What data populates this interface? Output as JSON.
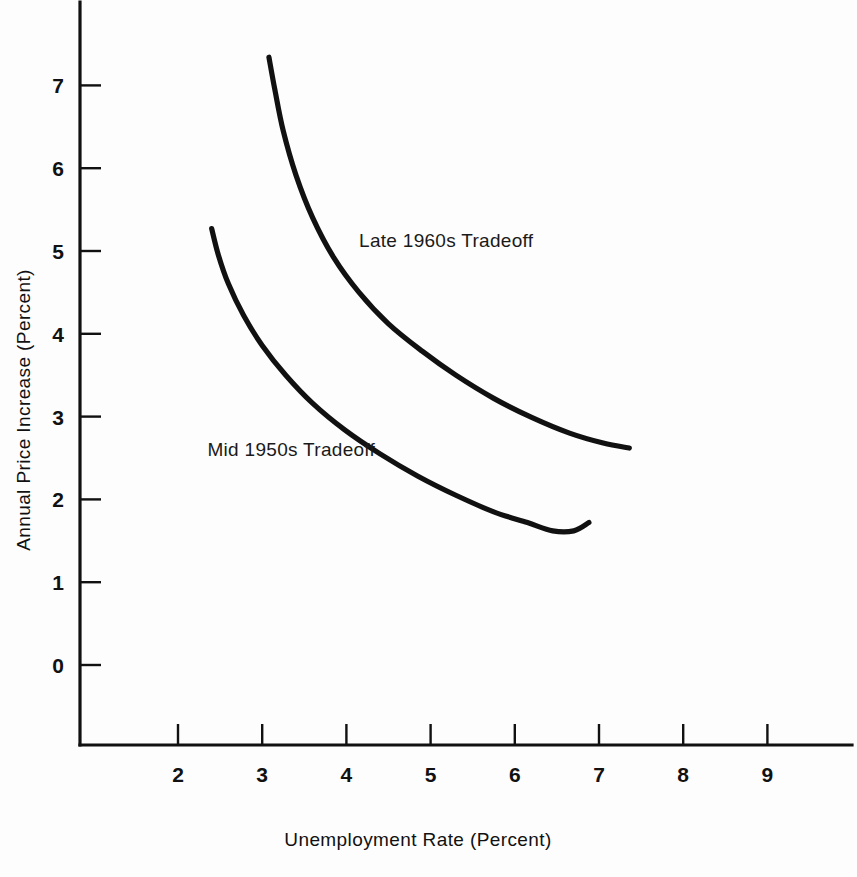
{
  "chart_data": {
    "type": "line",
    "title": "",
    "xlabel": "Unemployment Rate (Percent)",
    "ylabel": "Annual Price Increase  (Percent)",
    "xlim": [
      1.2,
      9.8
    ],
    "ylim": [
      -0.95,
      7.9
    ],
    "xticks": [
      "2",
      "3",
      "4",
      "5",
      "6",
      "7",
      "8",
      "9"
    ],
    "xtick_values": [
      2,
      3,
      4,
      5,
      6,
      7,
      8,
      9
    ],
    "yticks": [
      "0",
      "1",
      "2",
      "3",
      "4",
      "5",
      "6",
      "7"
    ],
    "ytick_values": [
      0,
      1,
      2,
      3,
      4,
      5,
      6,
      7
    ],
    "grid": false,
    "legend_position": "inline-annotation",
    "line_color": "#111111",
    "background_color": "#fdfdfd",
    "series": [
      {
        "name": "Late 1960s Tradeoff",
        "label_x": 4.15,
        "label_y": 5.05,
        "points": [
          [
            3.08,
            7.34
          ],
          [
            3.15,
            6.95
          ],
          [
            3.25,
            6.45
          ],
          [
            3.4,
            5.92
          ],
          [
            3.6,
            5.4
          ],
          [
            3.85,
            4.92
          ],
          [
            4.15,
            4.5
          ],
          [
            4.5,
            4.12
          ],
          [
            4.9,
            3.79
          ],
          [
            5.3,
            3.5
          ],
          [
            5.75,
            3.22
          ],
          [
            6.2,
            2.99
          ],
          [
            6.65,
            2.8
          ],
          [
            7.05,
            2.68
          ],
          [
            7.36,
            2.62
          ]
        ]
      },
      {
        "name": "Mid 1950s Tradeoff",
        "label_x": 2.35,
        "label_y": 2.52,
        "points": [
          [
            2.4,
            5.27
          ],
          [
            2.48,
            4.95
          ],
          [
            2.6,
            4.6
          ],
          [
            2.78,
            4.22
          ],
          [
            3.0,
            3.86
          ],
          [
            3.28,
            3.5
          ],
          [
            3.6,
            3.16
          ],
          [
            3.98,
            2.84
          ],
          [
            4.4,
            2.55
          ],
          [
            4.85,
            2.28
          ],
          [
            5.3,
            2.05
          ],
          [
            5.75,
            1.85
          ],
          [
            6.15,
            1.72
          ],
          [
            6.45,
            1.62
          ],
          [
            6.7,
            1.62
          ],
          [
            6.88,
            1.72
          ]
        ]
      }
    ]
  }
}
